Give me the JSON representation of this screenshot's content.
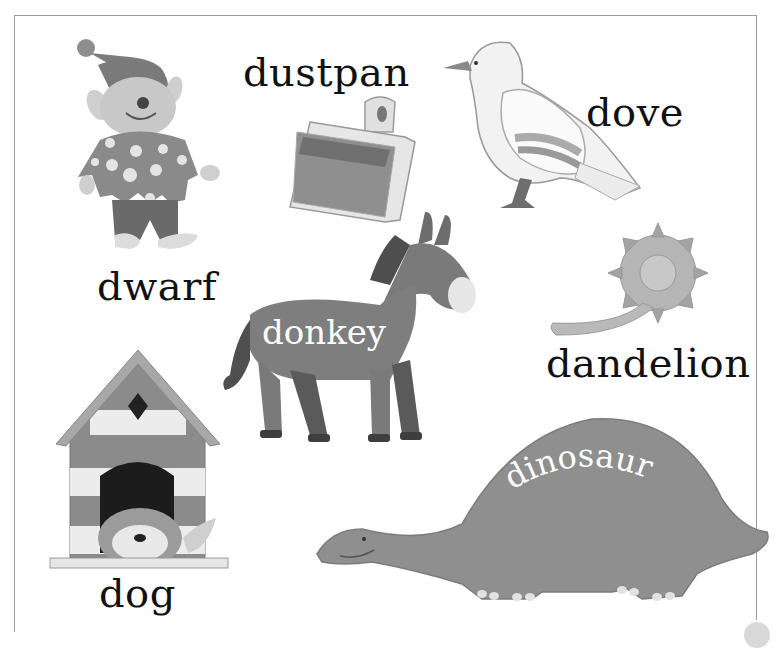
{
  "page": {
    "background": "#ffffff",
    "frame_color": "#9a9a9a"
  },
  "items": [
    {
      "id": "dwarf",
      "label": "dwarf",
      "icon": "dwarf-illustration"
    },
    {
      "id": "dustpan",
      "label": "dustpan",
      "icon": "dustpan-illustration"
    },
    {
      "id": "dove",
      "label": "dove",
      "icon": "dove-illustration"
    },
    {
      "id": "donkey",
      "label": "donkey",
      "icon": "donkey-illustration"
    },
    {
      "id": "dandelion",
      "label": "dandelion",
      "icon": "dandelion-illustration"
    },
    {
      "id": "dog",
      "label": "dog",
      "icon": "doghouse-with-dog-illustration"
    },
    {
      "id": "dinosaur",
      "label": "dinosaur",
      "icon": "dinosaur-illustration"
    }
  ],
  "colors": {
    "ink": "#111111",
    "mid_gray": "#8a8a8a",
    "dark_gray": "#5e5e5e",
    "light_gray": "#d6d6d6",
    "label_on_shape": "#ffffff"
  }
}
